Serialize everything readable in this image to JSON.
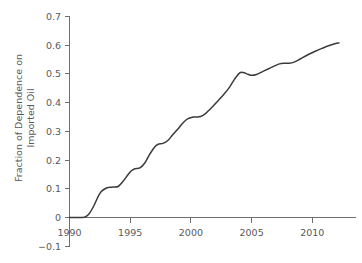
{
  "chart_data": {
    "type": "line",
    "title": "",
    "subtitle": "",
    "xlabel": "",
    "ylabel": "Fraction of Dependence on Imported Oil",
    "ylabel_line1": "Fraction of Dependence on",
    "ylabel_line2": "Imported Oil",
    "grid": false,
    "legend": false,
    "legend_position": "none",
    "xlim": [
      1990,
      2012.2
    ],
    "ylim": [
      -0.1,
      0.7
    ],
    "x_ticks": [
      1990,
      1995,
      2000,
      2005,
      2010
    ],
    "x_tick_labels": [
      "1990",
      "1995",
      "2000",
      "2005",
      "2010"
    ],
    "y_ticks": [
      -0.1,
      0,
      0.1,
      0.2,
      0.3,
      0.4,
      0.5,
      0.6,
      0.7
    ],
    "y_tick_labels": [
      "−0.1",
      "0",
      "0.1",
      "0.2",
      "0.3",
      "0.4",
      "0.5",
      "0.6",
      "0.7"
    ],
    "series": [
      {
        "name": "Fraction of Dependence on Imported Oil",
        "color": "#3b3b3d",
        "x": [
          1990.0,
          1990.5,
          1991.0,
          1991.3,
          1991.6,
          1992.0,
          1992.3,
          1992.6,
          1993.0,
          1993.3,
          1993.6,
          1994.0,
          1994.4,
          1994.8,
          1995.1,
          1995.4,
          1995.8,
          1996.2,
          1996.6,
          1997.0,
          1997.3,
          1997.7,
          1998.1,
          1998.5,
          1999.0,
          1999.4,
          1999.8,
          2000.1,
          2000.4,
          2000.8,
          2001.2,
          2001.7,
          2002.2,
          2002.7,
          2003.2,
          2003.6,
          2004.0,
          2004.3,
          2004.7,
          2005.0,
          2005.4,
          2005.9,
          2006.4,
          2006.9,
          2007.3,
          2007.7,
          2008.1,
          2008.5,
          2009.0,
          2009.6,
          2010.2,
          2010.8,
          2011.4,
          2012.0,
          2012.2
        ],
        "y": [
          0.0,
          0.0,
          0.0,
          0.002,
          0.012,
          0.04,
          0.068,
          0.09,
          0.102,
          0.105,
          0.106,
          0.108,
          0.125,
          0.148,
          0.163,
          0.17,
          0.173,
          0.19,
          0.22,
          0.245,
          0.255,
          0.258,
          0.268,
          0.288,
          0.312,
          0.332,
          0.345,
          0.349,
          0.35,
          0.352,
          0.362,
          0.382,
          0.405,
          0.428,
          0.455,
          0.482,
          0.503,
          0.505,
          0.499,
          0.495,
          0.498,
          0.508,
          0.518,
          0.528,
          0.535,
          0.537,
          0.537,
          0.541,
          0.552,
          0.566,
          0.578,
          0.589,
          0.599,
          0.607,
          0.608
        ]
      }
    ],
    "annotations": []
  }
}
